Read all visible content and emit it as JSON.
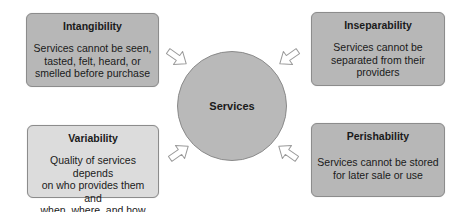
{
  "colors": {
    "box_fill": "#b7b7b7",
    "box_fill_light": "#dcdcdc",
    "circle_fill": "#b9b9b9",
    "border": "#8c8c8c",
    "arrow_fill": "#ffffff",
    "arrow_stroke": "#9a9a9a"
  },
  "center": {
    "label": "Services"
  },
  "boxes": [
    {
      "title": "Intangibility",
      "description": "Services cannot be seen, tasted, felt, heard, or smelled before purchase",
      "lines": [
        "Services cannot be seen,",
        "tasted, felt, heard, or",
        "smelled before purchase"
      ]
    },
    {
      "title": "Inseparability",
      "description": "Services cannot be separated from their providers",
      "lines": [
        "Services cannot be",
        "separated from their",
        "providers"
      ]
    },
    {
      "title": "Variability",
      "description": "Quality of services depends on who provides them and when, where, and how",
      "lines": [
        "Quality of services depends",
        "on who provides them and",
        "when, where, and how"
      ]
    },
    {
      "title": "Perishability",
      "description": "Services cannot be stored for later sale or use",
      "lines": [
        "Services cannot be stored",
        "for later sale or use"
      ]
    }
  ],
  "arrows": [
    {
      "from": "Intangibility",
      "to": "Services",
      "icon": "arrow-right-down-icon"
    },
    {
      "from": "Inseparability",
      "to": "Services",
      "icon": "arrow-left-down-icon"
    },
    {
      "from": "Variability",
      "to": "Services",
      "icon": "arrow-right-up-icon"
    },
    {
      "from": "Perishability",
      "to": "Services",
      "icon": "arrow-left-up-icon"
    }
  ]
}
